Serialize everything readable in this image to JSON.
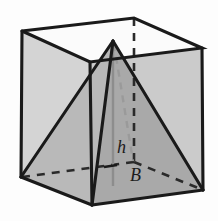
{
  "figure": {
    "background_color": "#fdfdfd",
    "labels": [
      {
        "id": "height-label",
        "text": "h",
        "x": 117,
        "y": 153,
        "font_size": 18
      },
      {
        "id": "base-label",
        "text": "B",
        "x": 130,
        "y": 180,
        "font_size": 18
      }
    ],
    "colors": {
      "outline": "#1a1a1a",
      "hidden_edge": "#1a1a1a",
      "cube_face_left": "#d3d3d3",
      "cube_face_right": "#c9c9c9",
      "cube_face_top": "#fbfbfb",
      "pyramid_face_left": "#bdbdbd",
      "pyramid_face_right": "#a8a8a8",
      "pyramid_face_front_left": "#b4b4b4",
      "altitude_line": "#8a8a8a"
    },
    "geometry": {
      "cube": {
        "top_left": [
          22,
          31
        ],
        "top_back": [
          134,
          18
        ],
        "top_right": [
          202,
          48
        ],
        "top_front": [
          90,
          62
        ],
        "bottom_left": [
          21,
          177
        ],
        "bottom_back": [
          134,
          162
        ],
        "bottom_right": [
          203,
          190
        ],
        "bottom_front": [
          92,
          205
        ]
      },
      "pyramid": {
        "apex": [
          113,
          41
        ],
        "base_left": [
          21,
          177
        ],
        "base_back": [
          134,
          162
        ],
        "base_right": [
          203,
          190
        ],
        "base_front": [
          92,
          205
        ],
        "base_center": [
          113,
          184
        ]
      },
      "hidden_edges": [
        {
          "id": "back-vertical-edge",
          "from": [
            134,
            18
          ],
          "to": [
            134,
            162
          ]
        },
        {
          "id": "base-diagonal-left",
          "from": [
            21,
            177
          ],
          "to": [
            134,
            162
          ]
        },
        {
          "id": "base-diagonal-right",
          "from": [
            134,
            162
          ],
          "to": [
            203,
            190
          ]
        },
        {
          "id": "apex-to-base-center-hidden",
          "from": [
            120,
            60
          ],
          "to": [
            127,
            166
          ]
        }
      ],
      "altitude": {
        "id": "altitude-h",
        "from": [
          113,
          46
        ],
        "to": [
          113,
          186
        ]
      }
    }
  }
}
